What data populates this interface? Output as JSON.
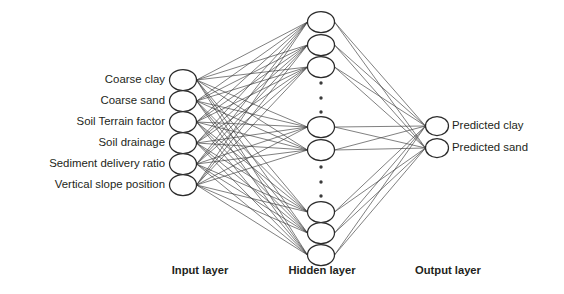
{
  "figure": {
    "kind": "neural-network-architecture-diagram",
    "background_color": "#ffffff",
    "node_fill_color": "#ffffff",
    "node_stroke_color": "#2b2b2b",
    "edge_color": "#3b3b3b",
    "text_color": "#231f20"
  },
  "input_layer": {
    "caption": "Input layer",
    "node_count": 6,
    "nodes": [
      {
        "label": "Coarse clay"
      },
      {
        "label": "Coarse sand"
      },
      {
        "label": "Soil Terrain factor"
      },
      {
        "label": "Soil drainage"
      },
      {
        "label": "Sediment delivery ratio"
      },
      {
        "label": "Vertical slope position"
      }
    ]
  },
  "hidden_layer": {
    "caption": "Hidden layer",
    "visible_node_count": 8,
    "ellipsis_groups": 2,
    "ellipsis_dots_per_group": 3,
    "ellipsis_meaning": "additional hidden units not drawn"
  },
  "output_layer": {
    "caption": "Output layer",
    "node_count": 2,
    "nodes": [
      {
        "label": "Predicted clay"
      },
      {
        "label": "Predicted sand"
      }
    ]
  },
  "connections": {
    "input_to_hidden": "fully-connected",
    "hidden_to_output": "fully-connected"
  },
  "geometry": {
    "input_x": 183,
    "hidden_x": 321,
    "output_x": 437,
    "node_rx": 13.5,
    "node_ry": 10.5,
    "output_rx": 11.5,
    "output_ry": 9.5,
    "input_node_y": [
      80,
      101,
      122,
      143,
      164,
      185
    ],
    "hidden_node_y": [
      22,
      45,
      67,
      127,
      150,
      212,
      233,
      255
    ],
    "output_node_y": [
      126,
      148
    ],
    "ellipsis_upper_y": [
      83,
      98,
      112
    ],
    "ellipsis_lower_y": [
      167,
      182,
      196
    ],
    "input_label_x": 165,
    "output_label_x": 452,
    "caption_y": 271,
    "input_caption_x": 200,
    "hidden_caption_x": 322,
    "output_caption_x": 448
  }
}
